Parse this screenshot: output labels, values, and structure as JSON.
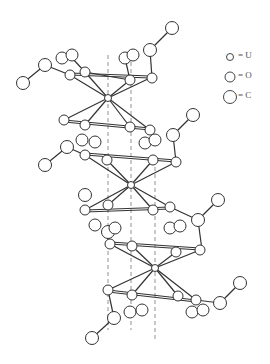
{
  "legend": {
    "items": [
      {
        "symbol": "small-circle",
        "label": "= U",
        "radius": 3.5
      },
      {
        "symbol": "medium-circle",
        "label": "= O",
        "radius": 5
      },
      {
        "symbol": "large-circle",
        "label": "= C",
        "radius": 6.5
      }
    ]
  },
  "colors": {
    "line": "#333333",
    "fill": "#ffffff",
    "axis": "#777777"
  },
  "uranium_centers": [
    {
      "x": 108,
      "y": 98
    },
    {
      "x": 131,
      "y": 185
    },
    {
      "x": 155,
      "y": 268
    }
  ]
}
